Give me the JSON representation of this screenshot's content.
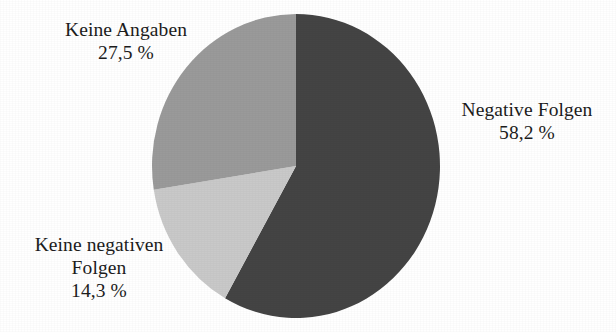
{
  "chart_data": {
    "type": "pie",
    "title": "",
    "subtitle": "",
    "xlabel": "",
    "ylabel": "",
    "legend_position": "none",
    "grid": false,
    "value_suffix": "%",
    "decimal_separator": ",",
    "start_angle_deg": 0,
    "direction": "clockwise",
    "categories": [
      "Negative Folgen",
      "Keine negativen Folgen",
      "Keine Angaben"
    ],
    "values": [
      58.2,
      14.3,
      27.5
    ],
    "value_labels": [
      "58,2 %",
      "14,3 %",
      "27,5 %"
    ],
    "colors": [
      "#444444",
      "#c9c9c9",
      "#9a9a9a"
    ],
    "slices": [
      {
        "id": "negative-folgen",
        "label": "Negative Folgen",
        "label_lines": [
          "Negative Folgen"
        ],
        "value": 58.2,
        "value_label": "58,2 %",
        "color": "#444444",
        "start_deg": 0,
        "end_deg": 209.52
      },
      {
        "id": "keine-negativen-folgen",
        "label": "Keine negativen Folgen",
        "label_lines": [
          "Keine negativen",
          "Folgen"
        ],
        "value": 14.3,
        "value_label": "14,3 %",
        "color": "#c9c9c9",
        "start_deg": 209.52,
        "end_deg": 260.99
      },
      {
        "id": "keine-angaben",
        "label": "Keine Angaben",
        "label_lines": [
          "Keine Angaben"
        ],
        "value": 27.5,
        "value_label": "27,5 %",
        "color": "#9a9a9a",
        "start_deg": 260.99,
        "end_deg": 360
      }
    ]
  },
  "labels": {
    "keine_angaben": {
      "name": "Keine Angaben",
      "value": "27,5 %"
    },
    "negative_folgen": {
      "name": "Negative Folgen",
      "value": "58,2 %"
    },
    "keine_negativen_folgen": {
      "name_line1": "Keine negativen",
      "name_line2": "Folgen",
      "value": "14,3 %"
    }
  },
  "geometry": {
    "center_x": 296,
    "center_y": 166,
    "radius_x": 144,
    "radius_y": 152
  },
  "theme": {
    "background": "#ffffff",
    "text": "#1c1c1c",
    "slice_dark": "#444444",
    "slice_medium": "#9a9a9a",
    "slice_light": "#c9c9c9"
  }
}
